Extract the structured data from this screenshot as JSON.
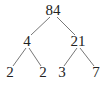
{
  "diagram": {
    "type": "factor-tree",
    "root": {
      "label": "84",
      "x": 53,
      "y": 15
    },
    "nodes": [
      {
        "id": "n84",
        "label": "84",
        "x": 53,
        "y": 15
      },
      {
        "id": "n4",
        "label": "4",
        "x": 27,
        "y": 46
      },
      {
        "id": "n21",
        "label": "21",
        "x": 78,
        "y": 46
      },
      {
        "id": "n2a",
        "label": "2",
        "x": 10,
        "y": 77
      },
      {
        "id": "n2b",
        "label": "2",
        "x": 43,
        "y": 77
      },
      {
        "id": "n3",
        "label": "3",
        "x": 62,
        "y": 77
      },
      {
        "id": "n7",
        "label": "7",
        "x": 96,
        "y": 77
      }
    ],
    "edges": [
      {
        "from": "84",
        "to": "4"
      },
      {
        "from": "84",
        "to": "21"
      },
      {
        "from": "4",
        "to": "2"
      },
      {
        "from": "4",
        "to": "2"
      },
      {
        "from": "21",
        "to": "3"
      },
      {
        "from": "21",
        "to": "7"
      }
    ],
    "colors": {
      "text": "#222222",
      "line": "#777777",
      "background": "#ffffff"
    }
  }
}
